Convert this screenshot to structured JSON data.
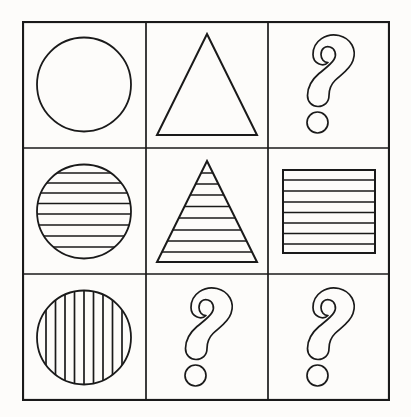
{
  "puzzle": {
    "type": "matrix-reasoning-3x3",
    "title": "Figure matrix puzzle",
    "background_color": "#fdfcfa",
    "stroke_color": "#1a1a1a",
    "grid": {
      "rows": 3,
      "cols": 3,
      "outer_border": true,
      "border_width_px": 2,
      "inner_line_width_px": 1.6,
      "left_px": 22,
      "top_px": 21,
      "width_px": 368,
      "height_px": 380,
      "col_edges_px": [
        0,
        124,
        246,
        368
      ],
      "row_edges_px": [
        0,
        127,
        253,
        380
      ]
    },
    "cells": [
      {
        "row": 1,
        "col": 1,
        "index": 0,
        "label": "circle-plain",
        "shape": "circle",
        "fill_pattern": "none",
        "stripe_count": 0,
        "is_question": false
      },
      {
        "row": 1,
        "col": 2,
        "index": 1,
        "label": "triangle-plain",
        "shape": "triangle",
        "fill_pattern": "none",
        "stripe_count": 0,
        "is_question": false
      },
      {
        "row": 1,
        "col": 3,
        "index": 2,
        "label": "question-mark",
        "shape": "question-mark",
        "fill_pattern": "none",
        "stripe_count": 0,
        "is_question": true
      },
      {
        "row": 2,
        "col": 1,
        "index": 3,
        "label": "circle-horizontal-stripes",
        "shape": "circle",
        "fill_pattern": "horizontal-stripes",
        "stripe_count": 8,
        "is_question": false
      },
      {
        "row": 2,
        "col": 2,
        "index": 4,
        "label": "triangle-horizontal-stripes",
        "shape": "triangle",
        "fill_pattern": "horizontal-stripes",
        "stripe_count": 8,
        "is_question": false
      },
      {
        "row": 2,
        "col": 3,
        "index": 5,
        "label": "square-horizontal-stripes",
        "shape": "square",
        "fill_pattern": "horizontal-stripes",
        "stripe_count": 7,
        "is_question": false
      },
      {
        "row": 3,
        "col": 1,
        "index": 6,
        "label": "circle-vertical-stripes",
        "shape": "circle",
        "fill_pattern": "vertical-stripes",
        "stripe_count": 9,
        "is_question": false
      },
      {
        "row": 3,
        "col": 2,
        "index": 7,
        "label": "question-mark",
        "shape": "question-mark",
        "fill_pattern": "none",
        "stripe_count": 0,
        "is_question": true
      },
      {
        "row": 3,
        "col": 3,
        "index": 8,
        "label": "question-mark",
        "shape": "question-mark",
        "fill_pattern": "none",
        "stripe_count": 0,
        "is_question": true
      }
    ]
  }
}
